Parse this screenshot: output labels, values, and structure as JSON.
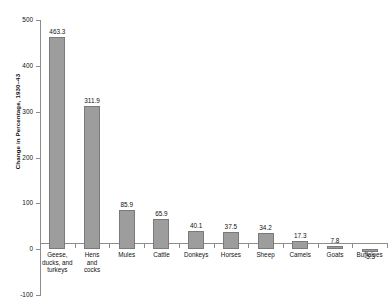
{
  "chart_data": {
    "type": "bar",
    "title": "",
    "subtitle": "",
    "xlabel": "",
    "ylabel": "Change in Percentage, 1930–43",
    "ylim": [
      -100,
      500
    ],
    "ytick_values": [
      500,
      400,
      300,
      200,
      100,
      0,
      -100
    ],
    "ytick_labels": [
      "500",
      "400",
      "300",
      "200",
      "100",
      "0",
      "-100"
    ],
    "grid": false,
    "legend": null,
    "bar_color": "#9d9d9d",
    "bar_edge_color": "#7a7a7a",
    "axis_color": "#8d8d8d",
    "categories": [
      "Geese, ducks, and turkeys",
      "Hens and cocks",
      "Mules",
      "Cattle",
      "Donkeys",
      "Horses",
      "Sheep",
      "Camels",
      "Goats",
      "Buffaloes"
    ],
    "category_lines": [
      [
        "Geese,",
        "ducks, and",
        "turkeys"
      ],
      [
        "Hens",
        "and",
        "cocks"
      ],
      [
        "Mules"
      ],
      [
        "Cattle"
      ],
      [
        "Donkeys"
      ],
      [
        "Horses"
      ],
      [
        "Sheep"
      ],
      [
        "Camels"
      ],
      [
        "Goats"
      ],
      [
        "Buffaloes"
      ]
    ],
    "values": [
      463.3,
      311.9,
      85.9,
      65.9,
      40.1,
      37.5,
      34.2,
      17.3,
      7.8,
      -5.3
    ],
    "value_labels": [
      "463.3",
      "311.9",
      "85.9",
      "65.9",
      "40.1",
      "37.5",
      "34.2",
      "17.3",
      "7.8",
      "-5.3"
    ]
  }
}
